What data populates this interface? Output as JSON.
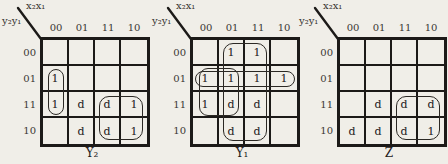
{
  "background_color": "#f0eee8",
  "ink_color": "#1c1a18",
  "maps": [
    {
      "id": "y2",
      "caption": "Y₂",
      "corner_top_label": "x₂x₁",
      "corner_side_label": "y₂y₁",
      "col_labels": [
        "00",
        "01",
        "11",
        "10"
      ],
      "row_labels": [
        "00",
        "01",
        "11",
        "10"
      ],
      "cells": [
        [
          "",
          "",
          "",
          ""
        ],
        [
          "1",
          "",
          "",
          ""
        ],
        [
          "1",
          "d",
          "d",
          "1"
        ],
        [
          "",
          "d",
          "d",
          "1"
        ]
      ],
      "groups": [
        {
          "label": "loop-col00-rows01-11",
          "rows": [
            1,
            2
          ],
          "cols": [
            0,
            0
          ],
          "ix": 5,
          "iy": 3,
          "radius": 8
        },
        {
          "label": "loop-rows11-10-cols11-10",
          "rows": [
            2,
            3
          ],
          "cols": [
            2,
            3
          ],
          "ix": 4,
          "iy": 4,
          "radius": 10
        }
      ]
    },
    {
      "id": "y1",
      "caption": "Y₁",
      "corner_top_label": "x₂x₁",
      "corner_side_label": "y₂y₁",
      "col_labels": [
        "00",
        "01",
        "11",
        "10"
      ],
      "row_labels": [
        "00",
        "01",
        "11",
        "10"
      ],
      "cells": [
        [
          "",
          "1",
          "1",
          ""
        ],
        [
          "1",
          "1",
          "1",
          "1"
        ],
        [
          "1",
          "d",
          "d",
          ""
        ],
        [
          "",
          "d",
          "d",
          ""
        ]
      ],
      "groups": [
        {
          "label": "loop-cols01-11-all-rows",
          "rows": [
            0,
            3
          ],
          "cols": [
            1,
            2
          ],
          "ix": 4,
          "iy": 3,
          "radius": 10
        },
        {
          "label": "loop-row01-all-cols",
          "rows": [
            1,
            1
          ],
          "cols": [
            0,
            3
          ],
          "ix": 2,
          "iy": 5,
          "radius": 8
        },
        {
          "label": "loop-rows01-11-cols00-01",
          "rows": [
            1,
            2
          ],
          "cols": [
            0,
            1
          ],
          "ix": 6,
          "iy": 2,
          "radius": 9
        }
      ]
    },
    {
      "id": "z",
      "caption": "Z",
      "corner_top_label": "x₂x₁",
      "corner_side_label": "y₂y₁",
      "col_labels": [
        "00",
        "01",
        "11",
        "10"
      ],
      "row_labels": [
        "00",
        "01",
        "11",
        "10"
      ],
      "cells": [
        [
          "",
          "",
          "",
          ""
        ],
        [
          "",
          "",
          "",
          ""
        ],
        [
          "",
          "d",
          "d",
          "d"
        ],
        [
          "d",
          "d",
          "d",
          "1"
        ]
      ],
      "groups": [
        {
          "label": "loop-rows11-10-cols11-10",
          "rows": [
            2,
            3
          ],
          "cols": [
            2,
            3
          ],
          "ix": 4,
          "iy": 4,
          "radius": 10
        }
      ]
    }
  ]
}
